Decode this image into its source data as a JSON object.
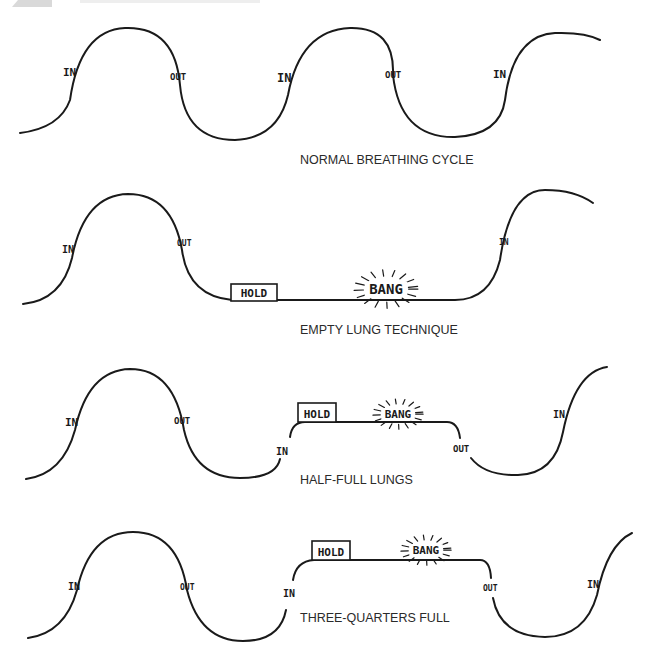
{
  "header": {
    "visible_partial": true
  },
  "panels": [
    {
      "id": "normal",
      "caption": "NORMAL BREATHING CYCLE",
      "caption_pos": [
        300,
        164
      ],
      "path": "M 20 133 Q 60 128 70 100 Q 80 30 125 28 Q 175 26 180 85 Q 185 140 235 140 Q 278 138 288 95 Q 300 30 350 28 Q 395 27 393 75 Q 400 138 455 137 Q 500 135 505 100 Q 513 35 555 33 Q 585 32 600 40",
      "labels": [
        {
          "text": "IN",
          "x": 63,
          "y": 76,
          "size": 11
        },
        {
          "text": "OUT",
          "x": 170,
          "y": 80,
          "size": 9
        },
        {
          "text": "IN",
          "x": 277,
          "y": 82,
          "size": 12
        },
        {
          "text": "OUT",
          "x": 385,
          "y": 78,
          "size": 9
        },
        {
          "text": "IN",
          "x": 493,
          "y": 78,
          "size": 11
        }
      ],
      "hold": null,
      "bang": null
    },
    {
      "id": "empty",
      "caption": "EMPTY LUNG TECHNIQUE",
      "caption_pos": [
        300,
        334
      ],
      "path": "M 23 304 Q 62 300 72 258 Q 84 195 128 194 Q 172 194 182 250 Q 188 296 232 300 L 455 300 Q 490 300 500 260 Q 510 190 545 190 Q 575 190 593 203",
      "labels": [
        {
          "text": "IN",
          "x": 62,
          "y": 253,
          "size": 10
        },
        {
          "text": "OUT",
          "x": 177,
          "y": 246,
          "size": 8
        },
        {
          "text": "IN",
          "x": 499,
          "y": 245,
          "size": 8
        }
      ],
      "hold": {
        "text": "HOLD",
        "x": 231,
        "y": 284,
        "w": 46,
        "h": 17
      },
      "bang": {
        "text": "BANG",
        "x": 386,
        "y": 294,
        "size": 14
      }
    },
    {
      "id": "half",
      "caption": "HALF-FULL LUNGS",
      "caption_pos": [
        300,
        484
      ],
      "path": "M 26 479 Q 63 474 75 430 Q 88 370 130 369 Q 174 369 184 430 Q 195 478 240 478 Q 276 478 280 459 M 290 437 Q 292 422 305 422 L 447 422 Q 458 422 460 438 M 471 458 Q 485 476 518 475 Q 555 474 563 432 Q 575 372 607 367",
      "labels": [
        {
          "text": "IN",
          "x": 65,
          "y": 426,
          "size": 11
        },
        {
          "text": "OUT",
          "x": 174,
          "y": 424,
          "size": 9
        },
        {
          "text": "IN",
          "x": 276,
          "y": 455,
          "size": 10
        },
        {
          "text": "OUT",
          "x": 453,
          "y": 452,
          "size": 9
        },
        {
          "text": "IN",
          "x": 553,
          "y": 418,
          "size": 10
        }
      ],
      "hold": {
        "text": "HOLD",
        "x": 298,
        "y": 403,
        "w": 38,
        "h": 19
      },
      "bang": {
        "text": "BANG",
        "x": 398,
        "y": 418,
        "size": 11
      }
    },
    {
      "id": "three_quarters",
      "caption": "THREE-QUARTERS FULL",
      "caption_pos": [
        300,
        622
      ],
      "path": "M 28 638 Q 65 633 77 590 Q 90 532 133 532 Q 178 532 187 590 Q 200 641 243 641 Q 280 641 286 610 M 293 580 Q 296 561 314 560 L 480 560 Q 490 560 491 578 M 493 598 Q 500 636 545 637 Q 585 637 597 595 Q 607 545 632 533",
      "labels": [
        {
          "text": "IN",
          "x": 68,
          "y": 590,
          "size": 10
        },
        {
          "text": "OUT",
          "x": 180,
          "y": 590,
          "size": 8
        },
        {
          "text": "IN",
          "x": 283,
          "y": 597,
          "size": 10
        },
        {
          "text": "OUT",
          "x": 483,
          "y": 591,
          "size": 8
        },
        {
          "text": "IN",
          "x": 587,
          "y": 588,
          "size": 10
        }
      ],
      "hold": {
        "text": "HOLD",
        "x": 312,
        "y": 541,
        "w": 38,
        "h": 19
      },
      "bang": {
        "text": "BANG",
        "x": 426,
        "y": 554,
        "size": 11
      }
    }
  ]
}
